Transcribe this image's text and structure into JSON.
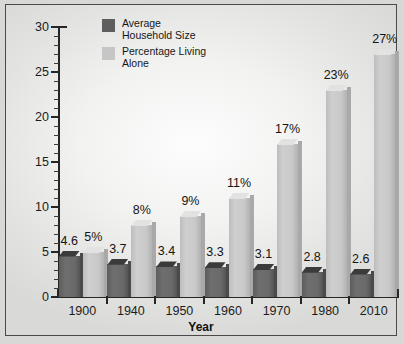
{
  "chart_data": {
    "type": "bar",
    "title": "",
    "subtitle": "",
    "xlabel": "Year",
    "ylabel": "",
    "categories": [
      "1900",
      "1940",
      "1950",
      "1960",
      "1970",
      "1980",
      "2010"
    ],
    "ylim": [
      0,
      30
    ],
    "yticks": [
      0,
      5,
      10,
      15,
      20,
      25,
      30
    ],
    "ytick_labels": [
      "0",
      "5",
      "10",
      "15",
      "20",
      "25",
      "30"
    ],
    "minor_tick_step": 1,
    "grid": false,
    "legend_position": "top-left inside plot",
    "series": [
      {
        "name": "Average Household Size",
        "color": "#5e5e5e",
        "values": [
          4.6,
          3.7,
          3.4,
          3.3,
          3.1,
          2.8,
          2.6
        ],
        "value_labels": [
          "4.6",
          "3.7",
          "3.4",
          "3.3",
          "3.1",
          "2.8",
          "2.6"
        ]
      },
      {
        "name": "Percentage Living Alone",
        "color": "#c6c6c6",
        "values": [
          5,
          8,
          9,
          11,
          17,
          23,
          27
        ],
        "value_labels": [
          "5%",
          "8%",
          "9%",
          "11%",
          "17%",
          "23%",
          "27%"
        ]
      }
    ]
  },
  "legend": {
    "items": [
      {
        "label_line1": "Average",
        "label_line2": "Household Size",
        "swatch": "dark"
      },
      {
        "label_line1": "Percentage Living",
        "label_line2": "Alone",
        "swatch": "light"
      }
    ]
  },
  "axis": {
    "x_title": "Year"
  }
}
